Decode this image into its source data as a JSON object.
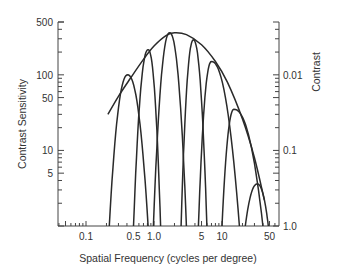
{
  "chart_data": {
    "type": "line",
    "title": "",
    "xlabel": "Spatial Frequency (cycles per degree)",
    "ylabel": "Contrast Sensitivity",
    "ylabel_right": "Contrast",
    "x_scale": "log",
    "y_scale": "log",
    "xlim": [
      0.04,
      50
    ],
    "ylim": [
      1,
      500
    ],
    "x_ticks": [
      {
        "value": 0.1,
        "label": "0.1"
      },
      {
        "value": 0.5,
        "label": "0.5"
      },
      {
        "value": 1.0,
        "label": "1.0"
      },
      {
        "value": 5,
        "label": "5"
      },
      {
        "value": 10,
        "label": "10"
      },
      {
        "value": 50,
        "label": "50"
      }
    ],
    "y_ticks_left": [
      {
        "value": 500,
        "label": "500"
      },
      {
        "value": 100,
        "label": "100"
      },
      {
        "value": 50,
        "label": "50"
      },
      {
        "value": 10,
        "label": "10"
      },
      {
        "value": 5,
        "label": "5"
      }
    ],
    "y_ticks_right": [
      {
        "value": 100,
        "label": "0.01"
      },
      {
        "value": 10,
        "label": "0.1"
      },
      {
        "value": 1,
        "label": "1.0"
      }
    ],
    "grid": false,
    "legend": null,
    "series": [
      {
        "name": "Envelope (contrast sensitivity function)",
        "x": [
          0.21,
          0.3,
          0.45,
          0.7,
          1.0,
          1.5,
          2.0,
          3.0,
          5.0,
          8.0,
          12.0,
          20.0,
          30.0,
          42.0
        ],
        "y": [
          30,
          52,
          90,
          160,
          240,
          330,
          360,
          340,
          250,
          150,
          80,
          26,
          8,
          2.2
        ]
      },
      {
        "name": "Channel 1",
        "peak_x": 0.41,
        "peak_y": 100,
        "x_low": 0.22,
        "x_high": 0.82
      },
      {
        "name": "Channel 2",
        "peak_x": 0.82,
        "peak_y": 215,
        "x_low": 0.5,
        "x_high": 1.25
      },
      {
        "name": "Channel 3",
        "peak_x": 1.7,
        "peak_y": 360,
        "x_low": 0.98,
        "x_high": 3.0
      },
      {
        "name": "Channel 4",
        "peak_x": 3.8,
        "peak_y": 290,
        "x_low": 2.5,
        "x_high": 6.0
      },
      {
        "name": "Channel 5",
        "peak_x": 7.0,
        "peak_y": 150,
        "x_low": 4.5,
        "x_high": 18.0
      },
      {
        "name": "Channel 6",
        "peak_x": 15.0,
        "peak_y": 35,
        "x_low": 10.0,
        "x_high": 40.0
      },
      {
        "name": "Channel 7",
        "peak_x": 33.0,
        "peak_y": 3.6,
        "x_low": 22.0,
        "x_high": 48.0
      }
    ]
  },
  "labels": {
    "xlabel": "Spatial Frequency (cycles per degree)",
    "ylabel_left": "Contrast Sensitivity",
    "ylabel_right": "Contrast"
  }
}
